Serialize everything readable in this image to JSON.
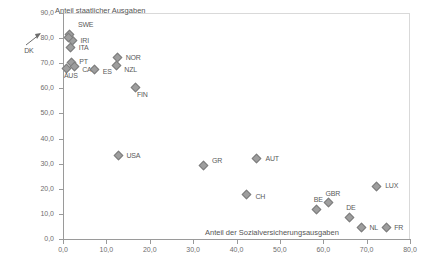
{
  "chart_data": {
    "type": "scatter",
    "title": "",
    "xlabel": "Anteil der Sozialversicherungsausgaben",
    "ylabel": "Anteil staatlicher Ausgaben",
    "xlim": [
      0.0,
      80.0
    ],
    "ylim": [
      0.0,
      90.0
    ],
    "xticks": [
      "0,0",
      "10,0",
      "20,0",
      "30,0",
      "40,0",
      "50,0",
      "60,0",
      "70,0",
      "80,0"
    ],
    "yticks": [
      "0,0",
      "10,0",
      "20,0",
      "30,0",
      "40,0",
      "50,0",
      "60,0",
      "70,0",
      "80,0",
      "90,0"
    ],
    "xtick_values": [
      0,
      10,
      20,
      30,
      40,
      50,
      60,
      70,
      80
    ],
    "ytick_values": [
      0,
      10,
      20,
      30,
      40,
      50,
      60,
      70,
      80,
      90
    ],
    "grid": false,
    "legend": "none",
    "marker": "diamond",
    "marker_color": "#9e9e9e",
    "marker_edge_color": "#7d7d7d",
    "points": [
      {
        "label": "SWE",
        "x": 1.6,
        "y": 81.5,
        "lx": 8,
        "ly": -9
      },
      {
        "label": "IRI",
        "x": 2.2,
        "y": 79.0,
        "lx": 8,
        "ly": 0
      },
      {
        "label": "ITA",
        "x": 1.8,
        "y": 76.2,
        "lx": 8,
        "ly": 0
      },
      {
        "label": "DK",
        "x": 1.2,
        "y": 80.3,
        "lx": -44,
        "ly": 14,
        "arrow": true
      },
      {
        "label": "PT",
        "x": 1.9,
        "y": 70.3,
        "lx": 8,
        "ly": 0
      },
      {
        "label": "CAN",
        "x": 2.6,
        "y": 68.6,
        "lx": 8,
        "ly": 3
      },
      {
        "label": "AUS",
        "x": 0.9,
        "y": 68.0,
        "lx": -3,
        "ly": 8
      },
      {
        "label": "ES",
        "x": 7.3,
        "y": 67.6,
        "lx": 8,
        "ly": 3
      },
      {
        "label": "NOR",
        "x": 12.6,
        "y": 72.2,
        "lx": 8,
        "ly": 0
      },
      {
        "label": "NZL",
        "x": 12.3,
        "y": 69.0,
        "lx": 8,
        "ly": 4
      },
      {
        "label": "FIN",
        "x": 16.6,
        "y": 60.5,
        "lx": 2,
        "ly": 8
      },
      {
        "label": "USA",
        "x": 12.8,
        "y": 33.2,
        "lx": 8,
        "ly": 0
      },
      {
        "label": "GR",
        "x": 32.3,
        "y": 29.3,
        "lx": 9,
        "ly": -4
      },
      {
        "label": "AUT",
        "x": 44.6,
        "y": 32.0,
        "lx": 9,
        "ly": 0
      },
      {
        "label": "CH",
        "x": 42.3,
        "y": 17.6,
        "lx": 9,
        "ly": 2
      },
      {
        "label": "LUX",
        "x": 72.2,
        "y": 21.0,
        "lx": 9,
        "ly": 0
      },
      {
        "label": "GBR",
        "x": 61.2,
        "y": 14.5,
        "lx": -3,
        "ly": -9
      },
      {
        "label": "BE",
        "x": 58.5,
        "y": 11.8,
        "lx": -3,
        "ly": -9
      },
      {
        "label": "DE",
        "x": 66.0,
        "y": 8.6,
        "lx": -3,
        "ly": -9
      },
      {
        "label": "NL",
        "x": 68.8,
        "y": 4.5,
        "lx": 8,
        "ly": 0
      },
      {
        "label": "FR",
        "x": 74.5,
        "y": 4.5,
        "lx": 8,
        "ly": 0
      }
    ]
  }
}
